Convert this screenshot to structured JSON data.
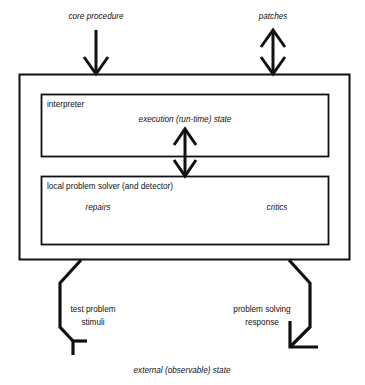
{
  "diagram": {
    "colors": {
      "line": "#111111",
      "background": "#ffffff",
      "text": "#111111"
    },
    "labels": {
      "core_procedure": "core procedure",
      "patches": "patches",
      "interpreter": "interpreter",
      "execution_state": "execution (run-time) state",
      "local_problem_solver": "local problem solver (and detector)",
      "repairs": "repairs",
      "critics": "critics",
      "test_problem": "test problem",
      "stimuli": "stimuli",
      "problem_solving": "problem solving",
      "response": "response",
      "external_state": "external (observable) state"
    },
    "boxes": [
      {
        "name": "outer-system-box",
        "label": ""
      },
      {
        "name": "interpreter-box",
        "label": "interpreter"
      },
      {
        "name": "local-problem-solver-box",
        "label": "local problem solver (and detector)"
      }
    ],
    "connectors": [
      {
        "name": "core-procedure-arrow",
        "label": "core procedure",
        "direction": "down",
        "heads": 1
      },
      {
        "name": "patches-arrow",
        "label": "patches",
        "direction": "bidirectional",
        "heads": 2
      },
      {
        "name": "execution-state-arrow",
        "label": "execution (run-time) state",
        "direction": "bidirectional",
        "heads": 2
      },
      {
        "name": "test-problem-stimuli-connector",
        "label": "test problem stimuli",
        "direction": "down-out",
        "heads": 1
      },
      {
        "name": "problem-solving-response-connector",
        "label": "problem solving response",
        "direction": "down-in",
        "heads": 1
      }
    ]
  }
}
